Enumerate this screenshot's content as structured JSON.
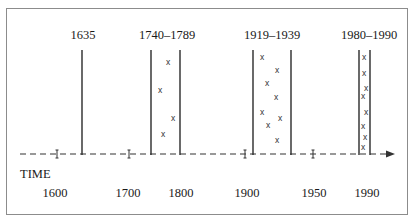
{
  "diagram": {
    "title_labels": [
      {
        "text": "1635",
        "x": 83
      },
      {
        "text": "1740–1789",
        "x": 167
      },
      {
        "text": "1919–1939",
        "x": 272
      },
      {
        "text": "1980–1990",
        "x": 369
      }
    ],
    "axis": {
      "name": "TIME",
      "ticks": [
        {
          "label": "1600",
          "tick_x": 57,
          "label_x": 55
        },
        {
          "label": "1700",
          "tick_x": 129,
          "label_x": 128
        },
        {
          "label": "1800",
          "tick_x": 181,
          "label_x": 181
        },
        {
          "label": "1900",
          "tick_x": 245,
          "label_x": 247
        },
        {
          "label": "1950",
          "tick_x": 313,
          "label_x": 314
        },
        {
          "label": "1990",
          "tick_x": 366,
          "label_x": 367
        }
      ],
      "arrow": "right-arrow"
    },
    "periods": [
      {
        "label": "1635",
        "lines": [
          82
        ],
        "marks": []
      },
      {
        "label": "1740–1789",
        "lines": [
          151,
          180
        ],
        "marks": [
          {
            "x": 168,
            "y": 62
          },
          {
            "x": 160,
            "y": 90
          },
          {
            "x": 173,
            "y": 118
          },
          {
            "x": 163,
            "y": 134
          }
        ]
      },
      {
        "label": "1919–1939",
        "lines": [
          253,
          291
        ],
        "marks": [
          {
            "x": 262,
            "y": 57
          },
          {
            "x": 277,
            "y": 70
          },
          {
            "x": 267,
            "y": 83
          },
          {
            "x": 276,
            "y": 97
          },
          {
            "x": 262,
            "y": 112
          },
          {
            "x": 280,
            "y": 118
          },
          {
            "x": 268,
            "y": 125
          },
          {
            "x": 277,
            "y": 140
          }
        ]
      },
      {
        "label": "1980–1990",
        "lines": [
          359,
          370
        ],
        "marks": [
          {
            "x": 364,
            "y": 57
          },
          {
            "x": 364,
            "y": 73
          },
          {
            "x": 366,
            "y": 88
          },
          {
            "x": 363,
            "y": 96
          },
          {
            "x": 366,
            "y": 112
          },
          {
            "x": 363,
            "y": 126
          },
          {
            "x": 365,
            "y": 137
          },
          {
            "x": 363,
            "y": 147
          }
        ]
      }
    ],
    "mark_symbol": "x"
  }
}
